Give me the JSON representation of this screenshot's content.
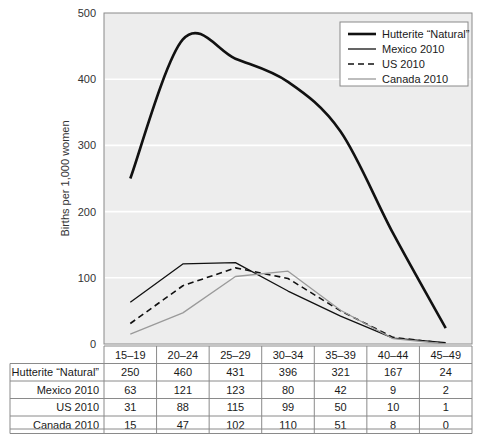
{
  "chart_data": {
    "type": "line",
    "title": "",
    "xlabel": "",
    "ylabel": "Births per 1,000 women",
    "categories": [
      "15–19",
      "20–24",
      "25–29",
      "30–34",
      "35–39",
      "40–44",
      "45–49"
    ],
    "ylim": [
      0,
      500
    ],
    "yticks": [
      0,
      100,
      200,
      300,
      400,
      500
    ],
    "ytick_labels": [
      "0",
      "100",
      "200",
      "300",
      "400",
      "500"
    ],
    "grid": "horizontal-white",
    "legend_position": "top-right",
    "series": [
      {
        "name": "Hutterite “Natural”",
        "values": [
          250,
          460,
          431,
          396,
          321,
          167,
          24
        ],
        "color": "#111111",
        "width": 2.6,
        "dash": "none",
        "smooth": true
      },
      {
        "name": "Mexico 2010",
        "values": [
          63,
          121,
          123,
          80,
          42,
          9,
          2
        ],
        "color": "#111111",
        "width": 1.3,
        "dash": "none",
        "smooth": false
      },
      {
        "name": "US 2010",
        "values": [
          31,
          88,
          115,
          99,
          50,
          10,
          1
        ],
        "color": "#111111",
        "width": 1.6,
        "dash": "6,4",
        "smooth": false
      },
      {
        "name": "Canada 2010",
        "values": [
          15,
          47,
          102,
          110,
          51,
          8,
          0
        ],
        "color": "#9a9a9a",
        "width": 1.3,
        "dash": "none",
        "smooth": false
      }
    ]
  },
  "legend": {
    "items": [
      {
        "label": "Hutterite “Natural”"
      },
      {
        "label": "Mexico 2010"
      },
      {
        "label": "US 2010"
      },
      {
        "label": "Canada 2010"
      }
    ]
  },
  "table": {
    "corner_label": "",
    "column_headers": [
      "15–19",
      "20–24",
      "25–29",
      "30–34",
      "35–39",
      "40–44",
      "45–49"
    ],
    "rows": [
      {
        "label": "Hutterite “Natural”",
        "values": [
          "250",
          "460",
          "431",
          "396",
          "321",
          "167",
          "24"
        ]
      },
      {
        "label": "Mexico 2010",
        "values": [
          "63",
          "121",
          "123",
          "80",
          "42",
          "9",
          "2"
        ]
      },
      {
        "label": "US 2010",
        "values": [
          "31",
          "88",
          "115",
          "99",
          "50",
          "10",
          "1"
        ]
      },
      {
        "label": "Canada 2010",
        "values": [
          "15",
          "47",
          "102",
          "110",
          "51",
          "8",
          "0"
        ]
      }
    ]
  },
  "colors": {
    "plot_background": "#ededed",
    "gridline": "#ffffff",
    "axis": "#8a8a8a",
    "primary_series": "#111111",
    "secondary_series": "#9a9a9a"
  }
}
